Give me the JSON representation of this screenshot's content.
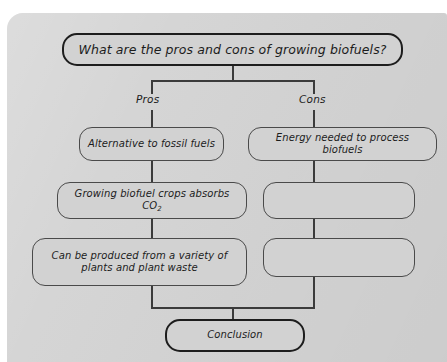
{
  "diagram": {
    "title_box": {
      "label": "What are the pros and cons of growing biofuels?"
    },
    "branches": [
      {
        "label": "Pros"
      },
      {
        "label": "Cons"
      }
    ],
    "pros_nodes": [
      {
        "label": "Alternative to fossil fuels"
      },
      {
        "label": "Growing biofuel crops absorbs CO",
        "subscript": "2"
      },
      {
        "label_line1": "Can be produced from a variety of",
        "label_line2": "plants and plant waste"
      }
    ],
    "cons_nodes": [
      {
        "label": "Energy needed to process biofuels"
      },
      {
        "label": ""
      },
      {
        "label": ""
      }
    ],
    "conclusion_box": {
      "label": "Conclusion"
    },
    "colors": {
      "paper": "#d3d3d3",
      "node_fill": "#d2d2d2",
      "node_stroke": "#4a4a4a",
      "emphasis_stroke": "#1d1d1d",
      "connector": "#3b3b3b",
      "text": "#1c1c1c"
    }
  }
}
